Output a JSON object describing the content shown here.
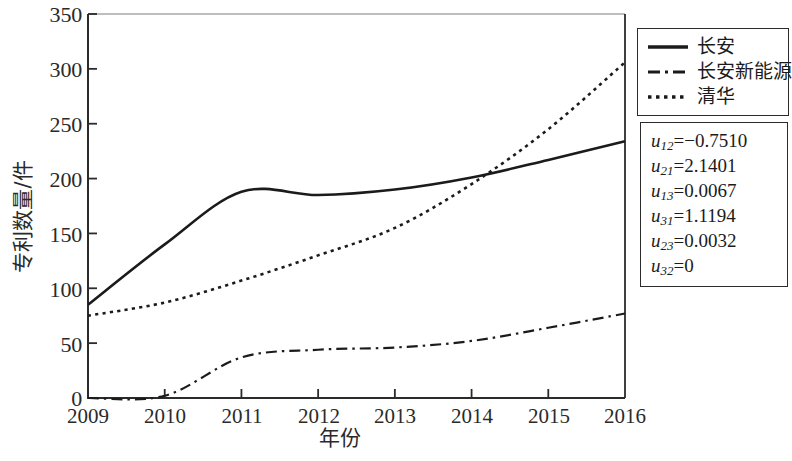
{
  "chart_data": {
    "type": "line",
    "title": "",
    "xlabel": "年份",
    "ylabel": "专利数量/件",
    "xlim": [
      2009,
      2016
    ],
    "ylim": [
      0,
      350
    ],
    "xticks": [
      "2009",
      "2010",
      "2011",
      "2012",
      "2013",
      "2014",
      "2015",
      "2016"
    ],
    "yticks": [
      "0",
      "50",
      "100",
      "150",
      "200",
      "250",
      "300",
      "350"
    ],
    "grid": false,
    "legend_position": "top-right",
    "x": [
      2009,
      2010,
      2011,
      2012,
      2013,
      2014,
      2015,
      2016
    ],
    "series": [
      {
        "name": "长安",
        "style": "solid",
        "values": [
          85,
          140,
          188,
          185,
          190,
          201,
          217,
          234
        ]
      },
      {
        "name": "长安新能源",
        "style": "dash-dot",
        "values": [
          0,
          2,
          37,
          44,
          46,
          52,
          64,
          77
        ]
      },
      {
        "name": "清华",
        "style": "dotted",
        "values": [
          75,
          87,
          107,
          130,
          155,
          195,
          245,
          306
        ]
      }
    ]
  },
  "legend": {
    "items": [
      {
        "label": "长安",
        "style": "solid"
      },
      {
        "label": "长安新能源",
        "style": "dash-dot"
      },
      {
        "label": "清华",
        "style": "dotted"
      }
    ]
  },
  "annotation": {
    "rows": [
      {
        "symbol": "u",
        "sub": "12",
        "eq": "=",
        "value": "−0.7510"
      },
      {
        "symbol": "u",
        "sub": "21",
        "eq": "=",
        "value": "2.1401"
      },
      {
        "symbol": "u",
        "sub": "13",
        "eq": "=",
        "value": "0.0067"
      },
      {
        "symbol": "u",
        "sub": "31",
        "eq": "=",
        "value": "1.1194"
      },
      {
        "symbol": "u",
        "sub": "23",
        "eq": "=",
        "value": "0.0032"
      },
      {
        "symbol": "u",
        "sub": "32",
        "eq": "=",
        "value": "0"
      }
    ]
  },
  "colors": {
    "line": "#1b1b1b",
    "axis": "#2b2b2b",
    "background": "#ffffff"
  }
}
